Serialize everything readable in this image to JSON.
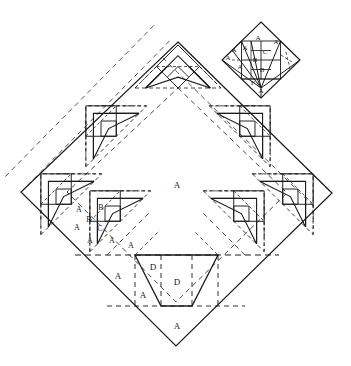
{
  "figure": {
    "type": "crease-pattern-diagram",
    "background_color": "#ffffff",
    "line_color": "#1a1a1a",
    "canvas": {
      "width": 351,
      "height": 366
    }
  },
  "main_pattern": {
    "name": "main-square-rotated-45",
    "corners": {
      "top": [
        178,
        42
      ],
      "right": [
        332,
        193
      ],
      "bottom": [
        176,
        346
      ],
      "left": [
        21,
        192
      ]
    },
    "center_label": "A",
    "modules_count": 4
  },
  "labels": {
    "center": "A",
    "left_module": [
      "A",
      "B",
      "B",
      "C",
      "A",
      "A",
      "A"
    ],
    "bottom_left": "A",
    "bottom_trapezoid": [
      "D",
      "D",
      "A"
    ],
    "bottom_apex": "A"
  },
  "label_list": [
    {
      "id": "center-a",
      "text": "A",
      "x": 177,
      "y": 186,
      "size": 9
    },
    {
      "id": "left-a1",
      "text": "A",
      "x": 79,
      "y": 210,
      "size": 8
    },
    {
      "id": "left-b1",
      "text": "B",
      "x": 101,
      "y": 208,
      "size": 8
    },
    {
      "id": "left-b2",
      "text": "B",
      "x": 89,
      "y": 220,
      "size": 8
    },
    {
      "id": "left-c1",
      "text": "C",
      "x": 100,
      "y": 229,
      "size": 8
    },
    {
      "id": "left-a2",
      "text": "A",
      "x": 77,
      "y": 228,
      "size": 8
    },
    {
      "id": "left-a3",
      "text": "A",
      "x": 90,
      "y": 241,
      "size": 8
    },
    {
      "id": "left-a4",
      "text": "A",
      "x": 112,
      "y": 241,
      "size": 8
    },
    {
      "id": "left-a5",
      "text": "A",
      "x": 131,
      "y": 246,
      "size": 8
    },
    {
      "id": "bot-a-left",
      "text": "A",
      "x": 118,
      "y": 277,
      "size": 9
    },
    {
      "id": "trap-d1",
      "text": "D",
      "x": 153,
      "y": 268,
      "size": 9
    },
    {
      "id": "trap-d2",
      "text": "D",
      "x": 177,
      "y": 283,
      "size": 9
    },
    {
      "id": "trap-a",
      "text": "A",
      "x": 143,
      "y": 296,
      "size": 9
    },
    {
      "id": "bot-apex-a",
      "text": "A",
      "x": 177,
      "y": 327,
      "size": 9
    }
  ],
  "inset": {
    "name": "inset-detail-diamond",
    "bounds": {
      "x": 222,
      "y": 22,
      "width": 78,
      "height": 76
    },
    "center": [
      261,
      60
    ],
    "labels": [
      {
        "id": "ins-a-top",
        "text": "A",
        "x": 258,
        "y": 38,
        "size": 7
      },
      {
        "id": "ins-a-tr",
        "text": "A",
        "x": 276,
        "y": 42,
        "size": 7
      },
      {
        "id": "ins-a-l1",
        "text": "A",
        "x": 234,
        "y": 50,
        "size": 7
      },
      {
        "id": "ins-a-l2",
        "text": "A",
        "x": 245,
        "y": 48,
        "size": 7
      },
      {
        "id": "ins-c",
        "text": "C",
        "x": 265,
        "y": 52,
        "size": 7
      },
      {
        "id": "ins-b1",
        "text": "B",
        "x": 255,
        "y": 60,
        "size": 7
      },
      {
        "id": "ins-a-l3",
        "text": "A",
        "x": 228,
        "y": 58,
        "size": 7
      },
      {
        "id": "ins-a-l4",
        "text": "A",
        "x": 240,
        "y": 67,
        "size": 7
      },
      {
        "id": "ins-b2",
        "text": "B",
        "x": 262,
        "y": 70,
        "size": 7
      },
      {
        "id": "ins-f",
        "text": "F",
        "x": 253,
        "y": 83,
        "size": 7
      },
      {
        "id": "ins-a-bot",
        "text": "A",
        "x": 261,
        "y": 91,
        "size": 7
      }
    ]
  }
}
